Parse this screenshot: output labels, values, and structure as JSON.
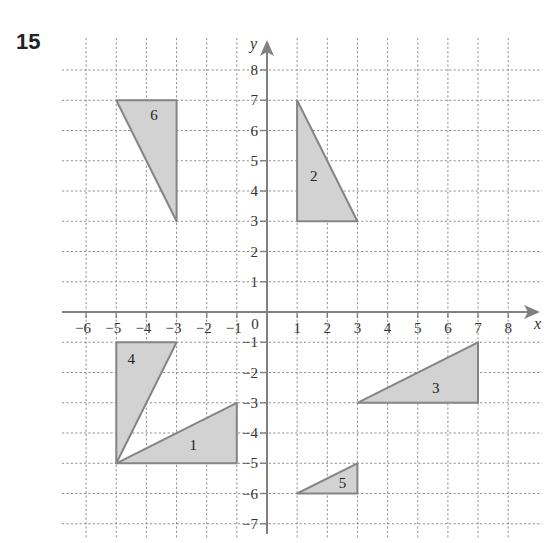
{
  "question_number": "15",
  "chart_data": {
    "type": "coordinate-grid",
    "title": "",
    "xlabel": "x",
    "ylabel": "y",
    "xlim": [
      -6,
      8
    ],
    "ylim": [
      -7,
      8
    ],
    "grid": true,
    "x_ticks": [
      -6,
      -5,
      -4,
      -3,
      -2,
      -1,
      1,
      2,
      3,
      4,
      5,
      6,
      7,
      8
    ],
    "y_ticks": [
      -7,
      -6,
      -5,
      -4,
      -3,
      -2,
      -1,
      1,
      2,
      3,
      4,
      5,
      6,
      7,
      8
    ],
    "origin_label": "0",
    "shapes": [
      {
        "label": "1",
        "vertices": [
          [
            -5,
            -5
          ],
          [
            -1,
            -5
          ],
          [
            -1,
            -3
          ]
        ],
        "label_pos": [
          -2.45,
          -4.4
        ]
      },
      {
        "label": "2",
        "vertices": [
          [
            1,
            7
          ],
          [
            1,
            3
          ],
          [
            3,
            3
          ]
        ],
        "label_pos": [
          1.55,
          4.5
        ]
      },
      {
        "label": "3",
        "vertices": [
          [
            3,
            -3
          ],
          [
            7,
            -3
          ],
          [
            7,
            -1
          ]
        ],
        "label_pos": [
          5.6,
          -2.5
        ]
      },
      {
        "label": "4",
        "vertices": [
          [
            -5,
            -1
          ],
          [
            -3,
            -1
          ],
          [
            -5,
            -5
          ]
        ],
        "label_pos": [
          -4.5,
          -1.55
        ]
      },
      {
        "label": "5",
        "vertices": [
          [
            1,
            -6
          ],
          [
            3,
            -6
          ],
          [
            3,
            -5
          ]
        ],
        "label_pos": [
          2.5,
          -5.65
        ]
      },
      {
        "label": "6",
        "vertices": [
          [
            -5,
            7
          ],
          [
            -3,
            7
          ],
          [
            -3,
            3
          ]
        ],
        "label_pos": [
          -3.75,
          6.5
        ]
      }
    ]
  },
  "colors": {
    "fill": "#d2d2d2",
    "stroke": "#858585",
    "axis": "#808080",
    "grid": "#8f8f8f"
  }
}
